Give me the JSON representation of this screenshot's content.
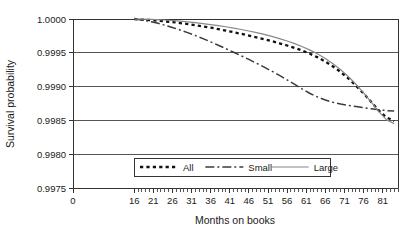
{
  "chart_data": {
    "type": "line",
    "title": "",
    "xlabel": "Months on books",
    "ylabel": "Survival probability",
    "xlim": [
      0,
      85
    ],
    "ylim": [
      0.9975,
      1.0
    ],
    "grid": true,
    "legend_position": "inside-bottom-center",
    "x_ticks": [
      0,
      16,
      21,
      26,
      31,
      36,
      41,
      46,
      51,
      56,
      61,
      66,
      71,
      76,
      81
    ],
    "x_tick_labels": [
      "0",
      "16",
      "21",
      "26",
      "31",
      "36",
      "41",
      "46",
      "51",
      "56",
      "61",
      "66",
      "71",
      "76",
      "81"
    ],
    "x_minor_tick_step": 1,
    "x_minor_tick_start": 16,
    "x_minor_tick_end": 85,
    "y_ticks": [
      0.9975,
      0.998,
      0.9985,
      0.999,
      0.9995,
      1.0
    ],
    "y_tick_labels": [
      "0.9975",
      "0.9980",
      "0.9985",
      "0.9990",
      "0.9995",
      "1.0000"
    ],
    "x": [
      16,
      18,
      20,
      22,
      24,
      26,
      28,
      30,
      32,
      34,
      36,
      38,
      40,
      42,
      44,
      46,
      48,
      50,
      52,
      54,
      56,
      58,
      60,
      62,
      64,
      66,
      68,
      70,
      72,
      74,
      76,
      78,
      80,
      82,
      84
    ],
    "series": [
      {
        "name": "All",
        "style": "dotted",
        "color": "#101010",
        "values": [
          1.0,
          0.99999,
          0.999985,
          0.999975,
          0.999965,
          0.999955,
          0.99994,
          0.999925,
          0.999908,
          0.99989,
          0.999872,
          0.99985,
          0.999828,
          0.999805,
          0.99978,
          0.999755,
          0.999728,
          0.9997,
          0.999672,
          0.99964,
          0.999608,
          0.999572,
          0.999532,
          0.999485,
          0.999432,
          0.99937,
          0.999298,
          0.999215,
          0.999122,
          0.999015,
          0.998898,
          0.998772,
          0.998645,
          0.998545,
          0.99849
        ]
      },
      {
        "name": "Small",
        "style": "dash-dot",
        "color": "#3a3a3a",
        "values": [
          1.0,
          0.999985,
          0.999965,
          0.99994,
          0.999908,
          0.999875,
          0.999838,
          0.999798,
          0.999755,
          0.99971,
          0.999662,
          0.999612,
          0.99956,
          0.999508,
          0.999455,
          0.999402,
          0.999345,
          0.999288,
          0.999228,
          0.999165,
          0.9991,
          0.999032,
          0.998962,
          0.998898,
          0.998845,
          0.998802,
          0.998768,
          0.998742,
          0.998722,
          0.998705,
          0.998688,
          0.998672,
          0.998658,
          0.998645,
          0.99864
        ]
      },
      {
        "name": "Large",
        "style": "solid",
        "color": "#888888",
        "values": [
          1.0,
          0.999998,
          0.999995,
          0.99999,
          0.999985,
          0.999978,
          0.999968,
          0.999958,
          0.999945,
          0.999932,
          0.999918,
          0.999902,
          0.999885,
          0.999865,
          0.999845,
          0.999822,
          0.999798,
          0.999772,
          0.999742,
          0.99971,
          0.999675,
          0.999635,
          0.99959,
          0.99954,
          0.999482,
          0.999415,
          0.999338,
          0.99925,
          0.99915,
          0.999035,
          0.998908,
          0.998772,
          0.99863,
          0.998508,
          0.998452
        ]
      }
    ],
    "legend": [
      {
        "label": "All",
        "style": "dotted"
      },
      {
        "label": "Small",
        "style": "dash-dot"
      },
      {
        "label": "Large",
        "style": "solid"
      }
    ]
  }
}
